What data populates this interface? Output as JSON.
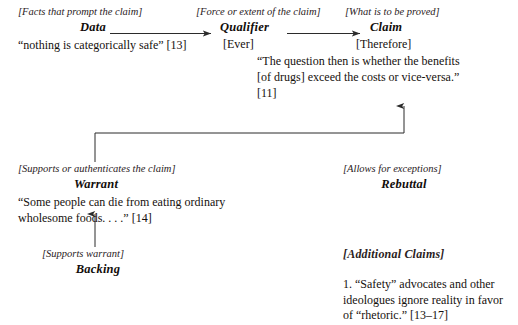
{
  "diagram": {
    "stroke_color": "#2b2b2b",
    "text_color": "#15100d"
  },
  "nodes": {
    "data": {
      "role": "[Facts that prompt the claim]",
      "term": "Data",
      "body": "“nothing is categorically safe” [13]"
    },
    "qualifier": {
      "role": "[Force or extent of the claim]",
      "term": "Qualifier",
      "connective": "[Ever]"
    },
    "claim": {
      "role": "[What is to be proved]",
      "term": "Claim",
      "connective": "[Therefore]",
      "body": "“The question then is whether the benefits [of drugs] exceed the costs or vice-versa.” [11]"
    },
    "warrant": {
      "role": "[Supports or authenticates the claim]",
      "term": "Warrant",
      "body": "“Some people can die from eating ordinary wholesome foods. . . .” [14]"
    },
    "rebuttal": {
      "role": "[Allows for exceptions]",
      "term": "Rebuttal"
    },
    "backing": {
      "role": "[Supports warrant]",
      "term": "Backing"
    },
    "additional_claims": {
      "heading": "[Additional Claims]",
      "body": "1. “Safety” advocates and other ideologues ignore reality in favor of “rhetoric.” [13–17]"
    }
  },
  "connectors": [
    {
      "name": "data-to-qualifier",
      "label": ""
    },
    {
      "name": "qualifier-to-claim",
      "label": ""
    },
    {
      "name": "warrant-to-claim",
      "label": ""
    },
    {
      "name": "backing-to-warrant",
      "label": ""
    }
  ]
}
